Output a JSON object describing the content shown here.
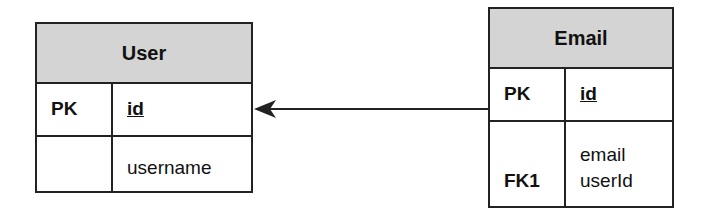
{
  "tables": {
    "user": {
      "title": "User",
      "rows": [
        {
          "key": "PK",
          "fields": [
            "id"
          ]
        },
        {
          "key": "",
          "fields": [
            "username"
          ]
        }
      ]
    },
    "email": {
      "title": "Email",
      "rows": [
        {
          "key": "PK",
          "fields": [
            "id"
          ]
        },
        {
          "key": "FK1",
          "fields": [
            "email",
            "userId"
          ]
        }
      ]
    }
  },
  "relationship": {
    "from": "Email",
    "to": "User"
  },
  "colors": {
    "header_fill": "#d4d4d4",
    "border": "#222222"
  }
}
